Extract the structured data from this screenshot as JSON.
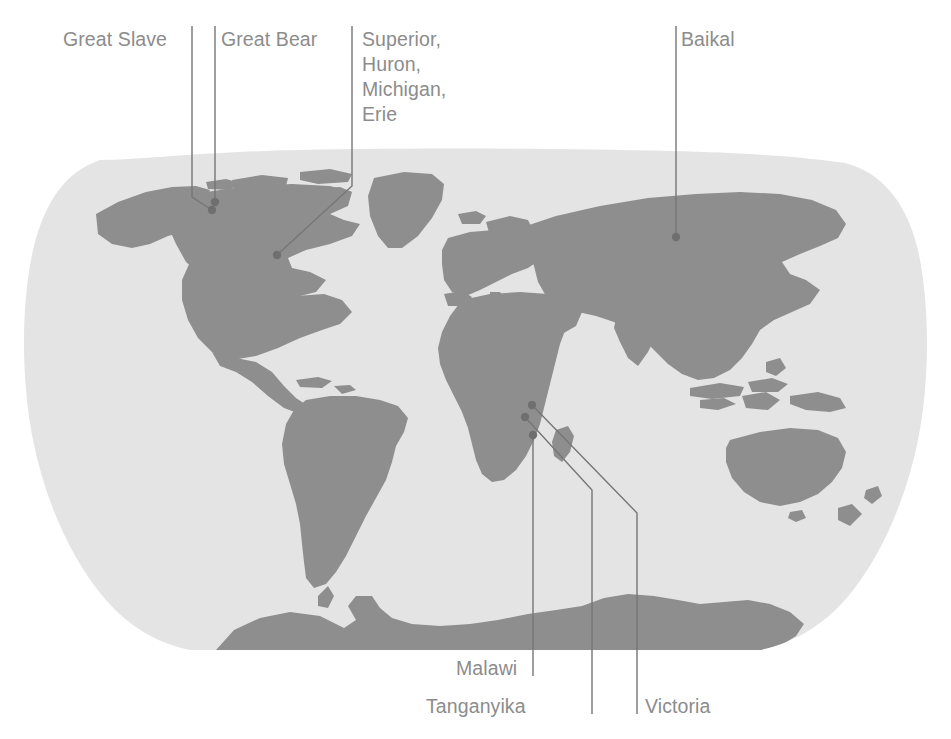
{
  "figure": {
    "type": "annotated-world-map",
    "projection": "robinson-like",
    "background_color": "#ffffff",
    "ocean_color": "#e4e4e4",
    "land_color": "#8e8e8e",
    "leader_line_color": "#767676",
    "label_color": "#8c8c8c",
    "marker_color": "#6f6f6f"
  },
  "labels": {
    "great_slave": "Great Slave",
    "great_bear": "Great Bear",
    "great_lakes": "Superior,\nHuron,\nMichigan,\nErie",
    "baikal": "Baikal",
    "malawi": "Malawi",
    "tanganyika": "Tanganyika",
    "victoria": "Victoria"
  },
  "annotations": [
    {
      "name": "great-slave",
      "label": "Great Slave",
      "label_x": 63,
      "label_y": 27,
      "marker_x": 212,
      "marker_y": 210
    },
    {
      "name": "great-bear",
      "label": "Great Bear",
      "label_x": 221,
      "label_y": 27,
      "marker_x": 215,
      "marker_y": 202
    },
    {
      "name": "great-lakes",
      "label": "Superior, Huron, Michigan, Erie",
      "label_x": 362,
      "label_y": 27,
      "marker_x": 277,
      "marker_y": 255
    },
    {
      "name": "baikal",
      "label": "Baikal",
      "label_x": 681,
      "label_y": 27,
      "marker_x": 676,
      "marker_y": 237
    },
    {
      "name": "malawi",
      "label": "Malawi",
      "label_x": 456,
      "label_y": 656,
      "marker_x": 533,
      "marker_y": 435
    },
    {
      "name": "tanganyika",
      "label": "Tanganyika",
      "label_x": 426,
      "label_y": 694,
      "marker_x": 525,
      "marker_y": 417
    },
    {
      "name": "victoria",
      "label": "Victoria",
      "label_x": 645,
      "label_y": 694,
      "marker_x": 532,
      "marker_y": 405
    }
  ]
}
